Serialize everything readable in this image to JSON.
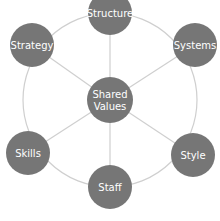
{
  "colors": {
    "node_fill": "#767676",
    "line": "#cfcfcf",
    "text": "#ffffff",
    "background": "#ffffff"
  },
  "ring": {
    "cx": 110,
    "cy": 100,
    "r": 87
  },
  "center": {
    "id": "shared-values",
    "lines": [
      "Shared",
      "Values"
    ],
    "cx": 110,
    "cy": 100,
    "r": 23
  },
  "nodes": [
    {
      "id": "structure",
      "label": "Structure",
      "cx": 110,
      "cy": 13,
      "r": 22
    },
    {
      "id": "systems",
      "label": "Systems",
      "cx": 195,
      "cy": 45,
      "r": 22
    },
    {
      "id": "style",
      "label": "Style",
      "cx": 193,
      "cy": 155,
      "r": 22
    },
    {
      "id": "staff",
      "label": "Staff",
      "cx": 110,
      "cy": 187,
      "r": 22
    },
    {
      "id": "skills",
      "label": "Skills",
      "cx": 28,
      "cy": 153,
      "r": 22
    },
    {
      "id": "strategy",
      "label": "Strategy",
      "cx": 32,
      "cy": 45,
      "r": 22
    }
  ]
}
